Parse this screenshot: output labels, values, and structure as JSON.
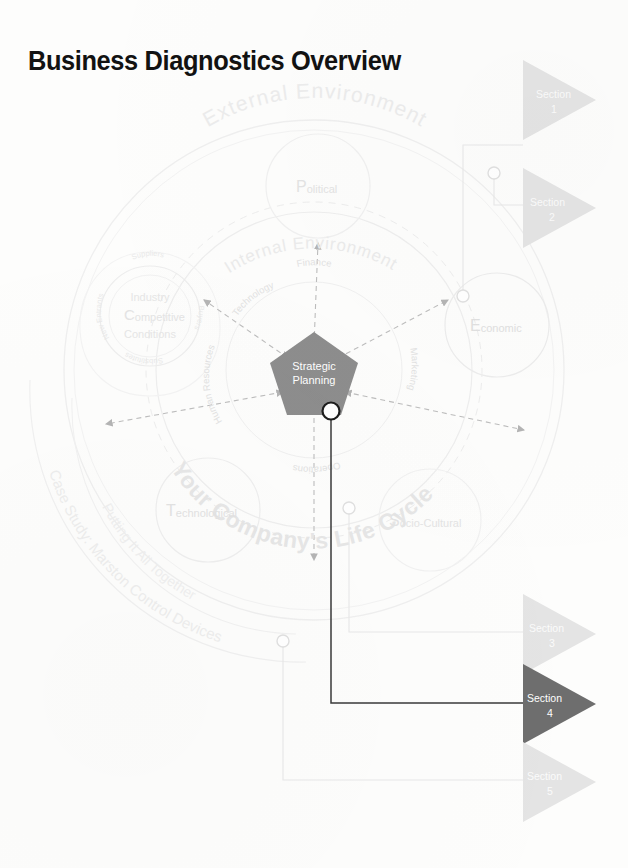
{
  "page": {
    "title": "Business Diagnostics Overview"
  },
  "diagram": {
    "outer_ring_label": "External Environment",
    "inner_ring_label": "Internal Environment",
    "lifecycle_label": "Your Company's Life Cycle",
    "case_study_label": "Case Study: Marston Control Devices",
    "putting_together_label": "Putting It All Together",
    "core": {
      "line1": "Strategic",
      "line2": "Planning"
    },
    "functions": [
      {
        "name": "Finance"
      },
      {
        "name": "Marketing"
      },
      {
        "name": "Operations"
      },
      {
        "name": "Human Resources"
      },
      {
        "name": "Technology"
      }
    ],
    "pest": [
      {
        "initial": "P",
        "rest": "olitical"
      },
      {
        "initial": "E",
        "rest": "conomic"
      },
      {
        "initial": "S",
        "rest": "ocio-Cultural"
      },
      {
        "initial": "T",
        "rest": "echnological"
      }
    ],
    "industry": {
      "initial": "C",
      "line1": "Industry",
      "line2": "ompetitive",
      "line3": "Conditions",
      "forces": [
        "Suppliers",
        "Buyers",
        "Substitutes",
        "New Entrants"
      ]
    }
  },
  "sections": [
    {
      "label": "Section",
      "number": "1",
      "active": false
    },
    {
      "label": "Section",
      "number": "2",
      "active": false
    },
    {
      "label": "Section",
      "number": "3",
      "active": false
    },
    {
      "label": "Section",
      "number": "4",
      "active": true
    },
    {
      "label": "Section",
      "number": "5",
      "active": false
    }
  ],
  "colors": {
    "title": "#121212",
    "core_fill": "#8d8d8d",
    "section_inactive": "#e4e4e4",
    "section_active": "#6e6e6e",
    "ghost_text": "#e9e9e9",
    "ghost_line": "#eeeeee",
    "connector_active": "#3a3a3a"
  }
}
